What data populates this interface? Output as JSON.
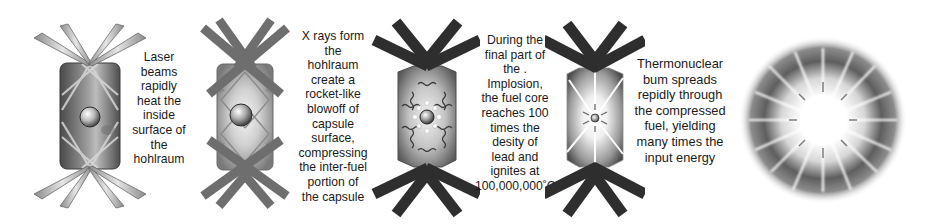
{
  "diagram": {
    "colors": {
      "background": "#ffffff",
      "text": "#1a1a1a",
      "beam_light": "#bfbfbf",
      "beam_dark": "#2e2e2e",
      "hohlraum_dark": "#555555",
      "hohlraum_light": "#d9d9d9"
    },
    "stages": [
      {
        "id": "stage-1",
        "illustration": "hohlraum-laser-beams",
        "caption": "Laser\nbeams\nrapidly\nheat the\ninside\nsurface of\nthe\nhohlraum"
      },
      {
        "id": "stage-2",
        "illustration": "hohlraum-xray-blowoff",
        "caption": "X rays form\nthe\nhohlraum\ncreate a\nrocket-like\nblowoff of\ncapsule\nsurface,\ncompressing\nthe inter-fuel\nportion of\nthe capsule"
      },
      {
        "id": "stage-3",
        "illustration": "hohlraum-implosion",
        "caption": "During the\nfinal part of\nthe   .\nImplosion,\nthe fuel core\nreaches 100\ntimes the\ndesity of\nlead and\nignites at\n100,000,000˚C"
      },
      {
        "id": "stage-4",
        "illustration": "hohlraum-thermonuclear-burn",
        "caption": "Thermonuclear\nbum spreads\nrepidly through\nthe compressed\nfuel, yielding\nmany times the\ninput energy"
      },
      {
        "id": "stage-5",
        "illustration": "fusion-starburst",
        "caption": ""
      }
    ]
  }
}
